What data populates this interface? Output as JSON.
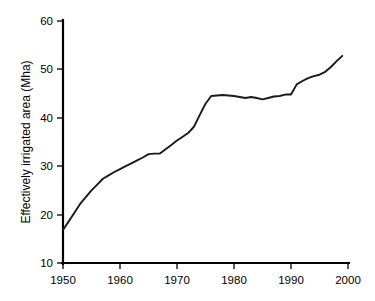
{
  "chart_data": {
    "type": "line",
    "title": "",
    "subtitle": "",
    "xlabel": "",
    "ylabel": "Effectively irrigated area (Mha)",
    "xlim": [
      1950,
      2000
    ],
    "ylim": [
      10,
      60
    ],
    "grid": false,
    "legend": null,
    "legend_position": "none",
    "xticks": [
      1950,
      1960,
      1970,
      1980,
      1990,
      2000
    ],
    "xtick_labels": [
      "1950",
      "1960",
      "1970",
      "1980",
      "1990",
      "2000"
    ],
    "yticks": [
      10,
      20,
      30,
      40,
      50,
      60
    ],
    "ytick_labels": [
      "10",
      "20",
      "30",
      "40",
      "50",
      "60"
    ],
    "line_color": "#1a1a1a",
    "series": [
      {
        "name": "Effectively irrigated area",
        "x": [
          1950,
          1951,
          1952,
          1953,
          1954,
          1955,
          1956,
          1957,
          1958,
          1959,
          1960,
          1961,
          1962,
          1963,
          1964,
          1965,
          1966,
          1967,
          1968,
          1969,
          1970,
          1971,
          1972,
          1973,
          1974,
          1975,
          1976,
          1977,
          1978,
          1979,
          1980,
          1981,
          1982,
          1983,
          1984,
          1985,
          1986,
          1987,
          1988,
          1989,
          1990,
          1991,
          1992,
          1993,
          1994,
          1995,
          1996,
          1997,
          1998,
          1999
        ],
        "values": [
          16.8,
          18.6,
          20.4,
          22.2,
          23.6,
          25.0,
          26.2,
          27.4,
          28.1,
          28.8,
          29.4,
          30.0,
          30.6,
          31.2,
          31.8,
          32.5,
          32.6,
          32.6,
          33.5,
          34.4,
          35.3,
          36.1,
          36.9,
          38.2,
          40.6,
          42.9,
          44.5,
          44.6,
          44.7,
          44.6,
          44.5,
          44.3,
          44.1,
          44.3,
          44.1,
          43.8,
          44.1,
          44.4,
          44.5,
          44.8,
          44.8,
          46.9,
          47.6,
          48.2,
          48.6,
          48.9,
          49.5,
          50.5,
          51.7,
          52.8
        ]
      }
    ]
  },
  "axis": {
    "y_title": "Effectively irrigated area (Mha)"
  }
}
